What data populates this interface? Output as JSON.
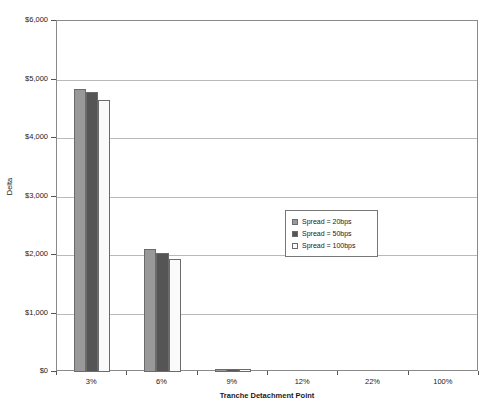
{
  "chart_data": {
    "type": "bar",
    "title": "Delta of Equity Tranche with respect to Spread",
    "xlabel": "Tranche Detachment Point",
    "ylabel": "Delta",
    "categories": [
      "3%",
      "6%",
      "9%",
      "12%",
      "22%",
      "100%"
    ],
    "ylim": [
      0,
      6000
    ],
    "ytick_values": [
      0,
      1000,
      2000,
      3000,
      4000,
      5000,
      6000
    ],
    "ytick_labels": [
      "$0",
      "$1,000",
      "$2,000",
      "$3,000",
      "$4,000",
      "$5,000",
      "$6,000"
    ],
    "grid": true,
    "legend_position": "center-right",
    "series": [
      {
        "name": "Spread = 20bps",
        "color": "#999999",
        "values": [
          4830,
          2110,
          55,
          0,
          0,
          0
        ]
      },
      {
        "name": "Spread = 50bps",
        "color": "#555555",
        "values": [
          4780,
          2040,
          50,
          0,
          0,
          0
        ]
      },
      {
        "name": "Spread = 100bps",
        "color": "#fafafa",
        "values": [
          4650,
          1930,
          45,
          0,
          0,
          0
        ]
      }
    ]
  },
  "colors": {
    "series_20bps": "#999999",
    "series_50bps": "#555555",
    "series_100bps": "#fafafa",
    "bar_border": "#6b6b6b",
    "gridline": "#b9b9b9",
    "axis": "#8a8a8a",
    "background": "#ffffff",
    "text": "#1a1a1a"
  }
}
